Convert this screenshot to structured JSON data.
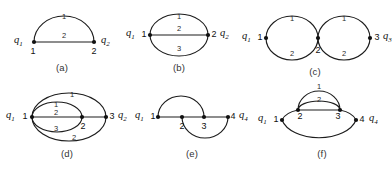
{
  "figure": {
    "background_color": "#ffffff",
    "line_color": "#1c1c1c",
    "panels": [
      {
        "id": "a",
        "caption": "(a)",
        "description": "Two vertices joined by one arc and one straight edge",
        "vertices": [
          {
            "name": "1",
            "q": "q",
            "q_sub": "1"
          },
          {
            "name": "2",
            "q": "q",
            "q_sub": "2"
          }
        ],
        "edge_labels": [
          "1",
          "2"
        ]
      },
      {
        "id": "b",
        "caption": "(b)",
        "description": "Theta graph: two vertices joined by three parallel edges",
        "vertices": [
          {
            "name": "1",
            "q": "q",
            "q_sub": "1"
          },
          {
            "name": "2",
            "q": "q",
            "q_sub": "2"
          }
        ],
        "edge_labels": [
          "1",
          "2",
          "3"
        ]
      },
      {
        "id": "c",
        "caption": "(c)",
        "description": "Two cycles sharing a middle vertex",
        "vertices": [
          {
            "name": "1",
            "q": "q",
            "q_sub": "1"
          },
          {
            "name": "2",
            "q": "",
            "q_sub": ""
          },
          {
            "name": "3",
            "q": "q",
            "q_sub": "3"
          }
        ],
        "edge_labels_left": [
          "1",
          "2"
        ],
        "edge_labels_right": [
          "1",
          "2"
        ]
      },
      {
        "id": "d",
        "caption": "(d)",
        "description": "Nested ellipses with inner vertex 2 and outer vertex 3",
        "vertices": [
          {
            "name": "1",
            "q": "q",
            "q_sub": "1"
          },
          {
            "name": "2",
            "q": "",
            "q_sub": ""
          },
          {
            "name": "3",
            "q": "q",
            "q_sub": "2"
          }
        ],
        "edge_labels_outer": [
          "1",
          "2"
        ],
        "edge_labels_inner": [
          "1",
          "2",
          "3"
        ]
      },
      {
        "id": "e",
        "caption": "(e)",
        "description": "Path 1-2-3-4 with arc above 1 to 3 and arc below 2 to 4",
        "vertices": [
          {
            "name": "1",
            "q": "q",
            "q_sub": "1"
          },
          {
            "name": "2",
            "q": "",
            "q_sub": ""
          },
          {
            "name": "3",
            "q": "",
            "q_sub": ""
          },
          {
            "name": "4",
            "q": "q",
            "q_sub": "4"
          }
        ],
        "edge_labels": []
      },
      {
        "id": "f",
        "caption": "(f)",
        "description": "Vertices 2 and 3 joined by two arcs, large lower arc from 1 to 4",
        "vertices": [
          {
            "name": "1",
            "q": "q",
            "q_sub": "1"
          },
          {
            "name": "2",
            "q": "",
            "q_sub": ""
          },
          {
            "name": "3",
            "q": "",
            "q_sub": ""
          },
          {
            "name": "4",
            "q": "q",
            "q_sub": "4"
          }
        ],
        "edge_labels": [
          "1",
          "2"
        ]
      }
    ]
  }
}
